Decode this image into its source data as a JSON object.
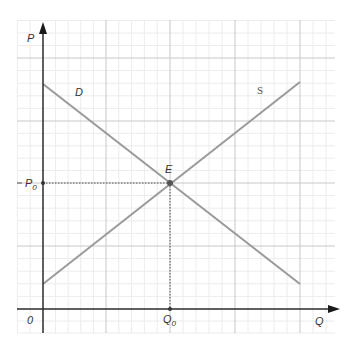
{
  "diagram": {
    "type": "supply-demand",
    "axes": {
      "y_label": "P",
      "x_label": "Q",
      "origin_label": "0"
    },
    "curves": [
      {
        "name": "demand",
        "label": "D",
        "from": [
          0,
          3.6
        ],
        "to": [
          4,
          0.4
        ]
      },
      {
        "name": "supply",
        "label": "S",
        "from": [
          0,
          0.4
        ],
        "to": [
          4,
          3.6
        ]
      }
    ],
    "equilibrium": {
      "label": "E",
      "price_label": "P",
      "price_subscript": "0",
      "quantity_label": "Q",
      "quantity_subscript": "0",
      "point": [
        2,
        2
      ]
    },
    "grid": {
      "major_step": 1,
      "minor_per_major": 5
    },
    "colors": {
      "axis": "#2b2b2b",
      "curve": "#9a9a9a",
      "grid_major": "#c8c8c8",
      "grid_minor": "#ececec",
      "guide": "#555555",
      "point": "#555555"
    }
  }
}
